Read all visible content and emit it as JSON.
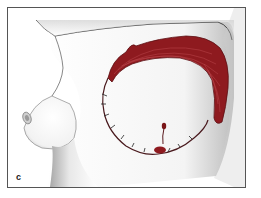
{
  "figure": {
    "panel_label": "c",
    "colors": {
      "frame_border": "#555555",
      "muscle": "#8e1a1f",
      "muscle_highlight": "#c8545a",
      "skin_shade": "#cfcfcf",
      "outline": "#3a3a3a"
    }
  }
}
